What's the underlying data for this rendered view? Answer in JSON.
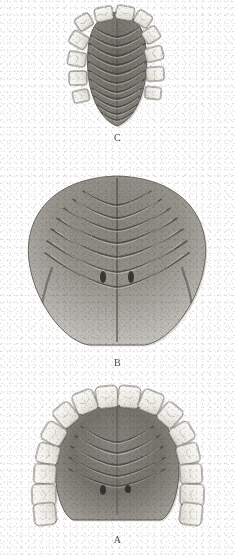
{
  "plate": {
    "medium": "engraving",
    "background_color": "#fefefe",
    "ink_color": "#4a4a48",
    "width": 235,
    "height": 555,
    "figure_count": 3
  },
  "figures": [
    {
      "id": "C",
      "label": "C",
      "label_x": 117,
      "label_y": 138,
      "order": 1,
      "description": "Narrow elongated palate with prominent transverse rugae and marginal teeth",
      "bbox": {
        "x": 72,
        "y": 6,
        "width": 92,
        "height": 122
      },
      "outline": {
        "shape": "narrow-oval-tapered",
        "center_x": 117,
        "top_y": 12,
        "bottom_y": 126,
        "half_width": 30
      },
      "midline": {
        "x": 117,
        "top": 20,
        "bottom": 122
      },
      "ruga_count": 11,
      "rugae": [
        {
          "y": 30,
          "half_width": 25,
          "depth": 7,
          "weight": 1.6
        },
        {
          "y": 39,
          "half_width": 27,
          "depth": 7,
          "weight": 1.7
        },
        {
          "y": 48,
          "half_width": 28,
          "depth": 8,
          "weight": 1.8
        },
        {
          "y": 57,
          "half_width": 29,
          "depth": 8,
          "weight": 1.8
        },
        {
          "y": 66,
          "half_width": 29,
          "depth": 8,
          "weight": 1.8
        },
        {
          "y": 75,
          "half_width": 28,
          "depth": 8,
          "weight": 1.7
        },
        {
          "y": 84,
          "half_width": 27,
          "depth": 8,
          "weight": 1.7
        },
        {
          "y": 92,
          "half_width": 25,
          "depth": 7,
          "weight": 1.6
        },
        {
          "y": 100,
          "half_width": 23,
          "depth": 7,
          "weight": 1.5
        },
        {
          "y": 108,
          "half_width": 20,
          "depth": 6,
          "weight": 1.4
        },
        {
          "y": 115,
          "half_width": 16,
          "depth": 5,
          "weight": 1.2
        }
      ],
      "teeth_count": 12,
      "teeth": [
        {
          "cx": 104,
          "cy": 14,
          "rx": 9,
          "ry": 7,
          "rot": -12
        },
        {
          "cx": 125,
          "cy": 13,
          "rx": 9,
          "ry": 7,
          "rot": 10
        },
        {
          "cx": 143,
          "cy": 19,
          "rx": 8,
          "ry": 7,
          "rot": 32
        },
        {
          "cx": 151,
          "cy": 35,
          "rx": 7,
          "ry": 8,
          "rot": 58
        },
        {
          "cx": 154,
          "cy": 54,
          "rx": 7,
          "ry": 9,
          "rot": 76
        },
        {
          "cx": 155,
          "cy": 74,
          "rx": 7,
          "ry": 9,
          "rot": 86
        },
        {
          "cx": 153,
          "cy": 93,
          "rx": 6,
          "ry": 8,
          "rot": 96
        },
        {
          "cx": 84,
          "cy": 22,
          "rx": 8,
          "ry": 7,
          "rot": -32
        },
        {
          "cx": 79,
          "cy": 40,
          "rx": 7,
          "ry": 9,
          "rot": -60
        },
        {
          "cx": 77,
          "cy": 59,
          "rx": 7,
          "ry": 9,
          "rot": -80
        },
        {
          "cx": 78,
          "cy": 78,
          "rx": 7,
          "ry": 9,
          "rot": -92
        },
        {
          "cx": 81,
          "cy": 96,
          "rx": 6,
          "ry": 8,
          "rot": -102
        }
      ]
    },
    {
      "id": "B",
      "label": "B",
      "label_x": 117,
      "label_y": 363,
      "order": 2,
      "description": "Broad rounded palate with chevron rugae, median raphe and paired pits, edentulous margin",
      "bbox": {
        "x": 24,
        "y": 174,
        "width": 186,
        "height": 172
      },
      "outline": {
        "shape": "broad-dome",
        "center_x": 117,
        "top_y": 176,
        "bottom_y": 345,
        "half_width": 92
      },
      "midline": {
        "x": 117,
        "top": 178,
        "bottom": 342
      },
      "ruga_count": 7,
      "rugae": [
        {
          "y": 196,
          "half_width": 34,
          "depth": 9,
          "weight": 1.4
        },
        {
          "y": 206,
          "half_width": 44,
          "depth": 12,
          "weight": 1.5
        },
        {
          "y": 216,
          "half_width": 53,
          "depth": 14,
          "weight": 1.6
        },
        {
          "y": 227,
          "half_width": 60,
          "depth": 16,
          "weight": 1.7
        },
        {
          "y": 239,
          "half_width": 66,
          "depth": 18,
          "weight": 1.7
        },
        {
          "y": 252,
          "half_width": 70,
          "depth": 20,
          "weight": 1.6
        },
        {
          "y": 265,
          "half_width": 72,
          "depth": 22,
          "weight": 1.4
        }
      ],
      "pits": [
        {
          "cx": 103,
          "cy": 277,
          "rx": 3,
          "ry": 6
        },
        {
          "cx": 131,
          "cy": 277,
          "rx": 3,
          "ry": 6
        }
      ],
      "lateral_folds": [
        {
          "x1": 52,
          "y1": 268,
          "x2": 40,
          "y2": 330
        },
        {
          "x1": 182,
          "y1": 268,
          "x2": 194,
          "y2": 330
        }
      ],
      "teeth_count": 0,
      "teeth": []
    },
    {
      "id": "A",
      "label": "A",
      "label_x": 117,
      "label_y": 540,
      "order": 3,
      "description": "Human maxillary palate, full dental arch of sixteen teeth with incisive pits",
      "bbox": {
        "x": 28,
        "y": 388,
        "width": 180,
        "height": 130
      },
      "outline": {
        "shape": "parabolic-arch",
        "center_x": 117,
        "top_y": 400,
        "bottom_y": 520,
        "half_width": 62
      },
      "midline": {
        "x": 117,
        "top": 404,
        "bottom": 515
      },
      "ruga_count": 5,
      "rugae": [
        {
          "y": 432,
          "half_width": 36,
          "depth": 10,
          "weight": 1.5
        },
        {
          "y": 442,
          "half_width": 42,
          "depth": 11,
          "weight": 1.6
        },
        {
          "y": 453,
          "half_width": 46,
          "depth": 12,
          "weight": 1.6
        },
        {
          "y": 464,
          "half_width": 48,
          "depth": 12,
          "weight": 1.4
        },
        {
          "y": 475,
          "half_width": 48,
          "depth": 11,
          "weight": 1.2
        }
      ],
      "pits": [
        {
          "cx": 103,
          "cy": 490,
          "rx": 3,
          "ry": 5
        },
        {
          "cx": 128,
          "cy": 489,
          "rx": 3,
          "ry": 4
        }
      ],
      "teeth_count": 16,
      "teeth": [
        {
          "cx": 107,
          "cy": 397,
          "rx": 11,
          "ry": 11,
          "rot": -6,
          "type": "central-incisor"
        },
        {
          "cx": 129,
          "cy": 397,
          "rx": 11,
          "ry": 11,
          "rot": 6,
          "type": "central-incisor"
        },
        {
          "cx": 85,
          "cy": 402,
          "rx": 11,
          "ry": 11,
          "rot": -22,
          "type": "lateral-incisor"
        },
        {
          "cx": 151,
          "cy": 402,
          "rx": 11,
          "ry": 11,
          "rot": 22,
          "type": "lateral-incisor"
        },
        {
          "cx": 66,
          "cy": 415,
          "rx": 10,
          "ry": 11,
          "rot": -40,
          "type": "canine"
        },
        {
          "cx": 170,
          "cy": 415,
          "rx": 10,
          "ry": 11,
          "rot": 40,
          "type": "canine"
        },
        {
          "cx": 54,
          "cy": 434,
          "rx": 10,
          "ry": 11,
          "rot": -60,
          "type": "first-premolar"
        },
        {
          "cx": 182,
          "cy": 434,
          "rx": 10,
          "ry": 11,
          "rot": 60,
          "type": "first-premolar"
        },
        {
          "cx": 48,
          "cy": 454,
          "rx": 10,
          "ry": 11,
          "rot": -76,
          "type": "second-premolar"
        },
        {
          "cx": 188,
          "cy": 454,
          "rx": 10,
          "ry": 11,
          "rot": 76,
          "type": "second-premolar"
        },
        {
          "cx": 45,
          "cy": 474,
          "rx": 10,
          "ry": 11,
          "rot": -86,
          "type": "first-molar"
        },
        {
          "cx": 191,
          "cy": 474,
          "rx": 10,
          "ry": 11,
          "rot": 86,
          "type": "first-molar"
        },
        {
          "cx": 44,
          "cy": 495,
          "rx": 11,
          "ry": 12,
          "rot": -92,
          "type": "second-molar"
        },
        {
          "cx": 192,
          "cy": 495,
          "rx": 11,
          "ry": 12,
          "rot": 92,
          "type": "second-molar"
        },
        {
          "cx": 45,
          "cy": 514,
          "rx": 11,
          "ry": 11,
          "rot": -96,
          "type": "third-molar"
        },
        {
          "cx": 191,
          "cy": 514,
          "rx": 11,
          "ry": 11,
          "rot": 96,
          "type": "third-molar"
        }
      ]
    }
  ]
}
